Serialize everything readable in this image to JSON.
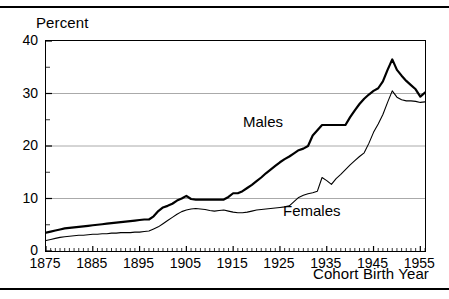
{
  "figure": {
    "clipped_caption": "",
    "top_rule": "horizontal-rule",
    "bottom_rule": "horizontal-rule"
  },
  "axes": {
    "ylabel": "Percent",
    "xlabel": "Cohort Birth Year",
    "y_ticks": [
      "0",
      "10",
      "20",
      "30",
      "40"
    ],
    "x_ticks": [
      "1875",
      "1885",
      "1895",
      "1905",
      "1915",
      "1925",
      "1935",
      "1945",
      "1955"
    ]
  },
  "labels": {
    "males": "Males",
    "females": "Females"
  },
  "colors": {
    "line": "#000000",
    "grid": "#aaaaaa",
    "background": "#ffffff",
    "text": "#000000"
  },
  "chart_data": {
    "type": "line",
    "title": "",
    "xlabel": "Cohort Birth Year",
    "ylabel": "Percent",
    "xlim": [
      1875,
      1956
    ],
    "ylim": [
      0,
      40
    ],
    "grid": true,
    "grid_axis": "y",
    "legend": "inline-annotations",
    "x": [
      1875,
      1876,
      1877,
      1878,
      1879,
      1880,
      1881,
      1882,
      1883,
      1884,
      1885,
      1886,
      1887,
      1888,
      1889,
      1890,
      1891,
      1892,
      1893,
      1894,
      1895,
      1896,
      1897,
      1898,
      1899,
      1900,
      1901,
      1902,
      1903,
      1904,
      1905,
      1906,
      1907,
      1908,
      1909,
      1910,
      1911,
      1912,
      1913,
      1914,
      1915,
      1916,
      1917,
      1918,
      1919,
      1920,
      1921,
      1922,
      1923,
      1924,
      1925,
      1926,
      1927,
      1928,
      1929,
      1930,
      1931,
      1932,
      1933,
      1934,
      1935,
      1936,
      1937,
      1938,
      1939,
      1940,
      1941,
      1942,
      1943,
      1944,
      1945,
      1946,
      1947,
      1948,
      1949,
      1950,
      1951,
      1952,
      1953,
      1954,
      1955,
      1956
    ],
    "series": [
      {
        "name": "Males",
        "linewidth": "thick",
        "values": [
          3.5,
          3.7,
          3.9,
          4.1,
          4.3,
          4.4,
          4.5,
          4.6,
          4.7,
          4.8,
          4.9,
          5.0,
          5.1,
          5.2,
          5.3,
          5.4,
          5.5,
          5.6,
          5.7,
          5.8,
          5.9,
          6.0,
          6.0,
          6.6,
          7.6,
          8.3,
          8.6,
          9.0,
          9.6,
          10.0,
          10.5,
          9.9,
          9.8,
          9.8,
          9.8,
          9.8,
          9.8,
          9.8,
          9.8,
          10.3,
          11.0,
          11.0,
          11.4,
          12.0,
          12.6,
          13.3,
          14.0,
          14.8,
          15.5,
          16.2,
          16.9,
          17.5,
          18.0,
          18.6,
          19.2,
          19.5,
          20.0,
          22.0,
          23.0,
          24.0,
          24.0,
          24.0,
          24.0,
          24.0,
          24.0,
          25.5,
          26.8,
          28.0,
          29.0,
          29.8,
          30.5,
          31.0,
          32.3,
          34.5,
          36.5,
          34.5,
          33.4,
          32.4,
          31.6,
          30.8,
          29.4,
          30.2
        ]
      },
      {
        "name": "Females",
        "linewidth": "thin",
        "values": [
          2.0,
          2.2,
          2.4,
          2.6,
          2.7,
          2.8,
          2.9,
          3.0,
          3.0,
          3.1,
          3.2,
          3.2,
          3.3,
          3.3,
          3.4,
          3.4,
          3.5,
          3.5,
          3.5,
          3.6,
          3.6,
          3.7,
          3.8,
          4.2,
          4.6,
          5.2,
          5.8,
          6.4,
          7.0,
          7.5,
          7.8,
          8.0,
          8.1,
          8.0,
          7.9,
          7.7,
          7.6,
          7.7,
          7.8,
          7.6,
          7.4,
          7.3,
          7.3,
          7.4,
          7.6,
          7.8,
          7.9,
          8.0,
          8.1,
          8.2,
          8.3,
          8.4,
          8.6,
          9.4,
          10.2,
          10.6,
          10.9,
          11.1,
          11.4,
          14.0,
          13.4,
          12.7,
          13.8,
          14.6,
          15.5,
          16.4,
          17.2,
          18.0,
          18.7,
          20.5,
          22.6,
          24.2,
          26.0,
          28.3,
          30.5,
          29.3,
          28.8,
          28.6,
          28.6,
          28.5,
          28.3,
          28.4
        ]
      }
    ],
    "annotations": [
      {
        "text": "Males",
        "x": 1917,
        "y": 22.5
      },
      {
        "text": "Females",
        "x": 1931,
        "y": 5.5
      }
    ]
  }
}
